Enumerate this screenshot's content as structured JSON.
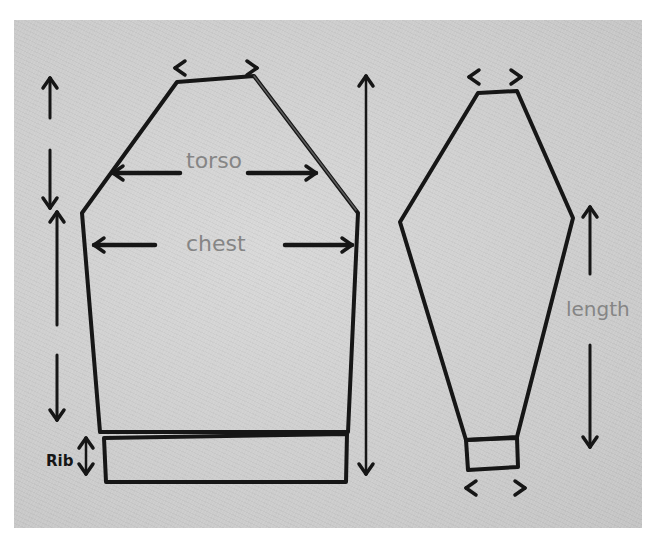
{
  "sketch": {
    "title": "Sweater pattern sketch",
    "colors": {
      "paper": "#cfcfcf",
      "ink": "#161616",
      "pencil": "#858585",
      "background": "#ffffff"
    },
    "labels": {
      "torso": "torso",
      "chest": "chest",
      "rib": "Rib",
      "length": "length"
    },
    "body_piece": {
      "outline": [
        [
          177,
          82
        ],
        [
          254,
          76
        ],
        [
          358,
          213
        ],
        [
          348,
          432
        ],
        [
          100,
          432
        ],
        [
          82,
          213
        ]
      ],
      "rib_band": [
        [
          104,
          438
        ],
        [
          347,
          434
        ],
        [
          346,
          482
        ],
        [
          106,
          482
        ]
      ]
    },
    "sleeve_piece": {
      "outline": [
        [
          478,
          93
        ],
        [
          517,
          91
        ],
        [
          573,
          218
        ],
        [
          517,
          437
        ],
        [
          466,
          440
        ],
        [
          400,
          222
        ]
      ],
      "cuff": [
        [
          466,
          440
        ],
        [
          517,
          438
        ],
        [
          518,
          467
        ],
        [
          468,
          470
        ]
      ]
    },
    "arrows": [
      {
        "name": "neck-width-arrows",
        "kind": "horizontal-split",
        "y": 68,
        "x1": 175,
        "x2": 257
      },
      {
        "name": "torso-arrow",
        "kind": "horizontal-split",
        "y": 173,
        "x1": 113,
        "x2": 316,
        "gap": [
          180,
          248
        ]
      },
      {
        "name": "chest-arrow",
        "kind": "horizontal-split",
        "y": 245,
        "x1": 94,
        "x2": 352,
        "gap": [
          155,
          285
        ]
      },
      {
        "name": "overall-length-arrow",
        "kind": "vertical",
        "x": 366,
        "y1": 76,
        "y2": 474
      },
      {
        "name": "yoke-depth-arrow",
        "kind": "vertical-split",
        "x": 50,
        "y1": 78,
        "y2": 208,
        "gap": [
          118,
          150
        ]
      },
      {
        "name": "body-depth-arrow",
        "kind": "vertical-split",
        "x": 57,
        "y1": 212,
        "y2": 420,
        "gap": [
          325,
          355
        ]
      },
      {
        "name": "rib-depth-arrow",
        "kind": "vertical",
        "x": 86,
        "y1": 438,
        "y2": 474
      },
      {
        "name": "sleeve-top-width-arrows",
        "kind": "horizontal-split",
        "y": 77,
        "x1": 469,
        "x2": 521
      },
      {
        "name": "sleeve-length-arrow",
        "kind": "vertical-split",
        "x": 590,
        "y1": 207,
        "y2": 447,
        "gap": [
          274,
          345
        ]
      },
      {
        "name": "cuff-width-arrows",
        "kind": "horizontal-split",
        "y": 488,
        "x1": 466,
        "x2": 525
      }
    ]
  }
}
